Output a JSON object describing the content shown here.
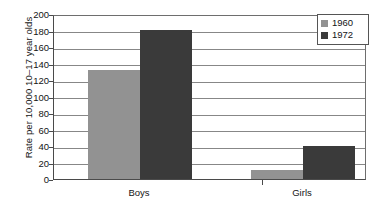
{
  "chart_data": {
    "type": "bar",
    "title": "",
    "xlabel": "",
    "ylabel": "Rate per 10,000 10–17 year olds",
    "categories": [
      "Boys",
      "Girls"
    ],
    "series": [
      {
        "name": "1960",
        "color": "#929292",
        "values": [
          132,
          11
        ]
      },
      {
        "name": "1972",
        "color": "#3a3a3a",
        "values": [
          181,
          40
        ]
      }
    ],
    "ylim": [
      0,
      200
    ],
    "y_ticks": [
      200,
      180,
      160,
      140,
      120,
      100,
      80,
      60,
      40,
      20,
      0
    ],
    "grid": true,
    "legend_position": "top-right"
  },
  "legend": {
    "entries": [
      {
        "label": "1960",
        "swatch": "legend-swatch-1960"
      },
      {
        "label": "1972",
        "swatch": "legend-swatch-1972"
      }
    ]
  },
  "axis": {
    "y_title": "Rate per 10,000 10–17 year olds",
    "ticks": [
      "200",
      "180",
      "160",
      "140",
      "120",
      "100",
      "80",
      "60",
      "40",
      "20",
      "0"
    ]
  },
  "categories": [
    {
      "label": "Boys"
    },
    {
      "label": "Girls"
    }
  ]
}
